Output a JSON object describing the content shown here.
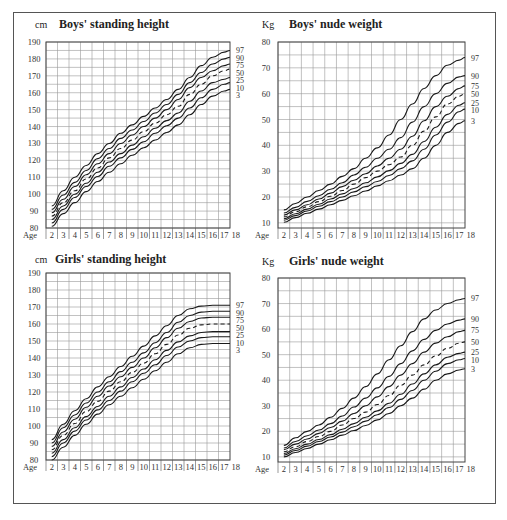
{
  "chart_data": [
    {
      "id": "boys-height",
      "type": "line",
      "title": "Boys' standing height",
      "ylabel": "cm",
      "xlabel": "Age",
      "x_ticks": [
        "2",
        "3",
        "4",
        "5",
        "6",
        "7",
        "8",
        "9",
        "10",
        "11",
        "12",
        "13",
        "14",
        "15",
        "16",
        "17",
        "18"
      ],
      "y_ticks": [
        80,
        90,
        100,
        110,
        120,
        130,
        140,
        150,
        160,
        170,
        180,
        190
      ],
      "ylim": [
        80,
        190
      ],
      "xlim": [
        2,
        18
      ],
      "grid": true,
      "legend_position": "right-end-labels",
      "x": [
        2,
        3,
        4,
        5,
        6,
        7,
        8,
        9,
        10,
        11,
        12,
        13,
        14,
        15,
        16,
        17,
        17.5
      ],
      "series": [
        {
          "name": "97",
          "dashed": false,
          "values": [
            93,
            102,
            110,
            117,
            124,
            130,
            136,
            141,
            146,
            151,
            156,
            162,
            169,
            176,
            181,
            184,
            185
          ]
        },
        {
          "name": "90",
          "dashed": false,
          "values": [
            91,
            99.5,
            107,
            114,
            121,
            127,
            133,
            138,
            143,
            148,
            153,
            159,
            166,
            172,
            177,
            180,
            181
          ]
        },
        {
          "name": "75",
          "dashed": false,
          "values": [
            89,
            97,
            104.5,
            111.5,
            118,
            124,
            130,
            135,
            140,
            145,
            150,
            156,
            163,
            169,
            173,
            176,
            177
          ]
        },
        {
          "name": "50",
          "dashed": true,
          "values": [
            87,
            95,
            102,
            109,
            115.5,
            121.5,
            127,
            132,
            137,
            142,
            147,
            152,
            159,
            165,
            170,
            173,
            174
          ]
        },
        {
          "name": "25",
          "dashed": false,
          "values": [
            85,
            93,
            100,
            106.5,
            113,
            119,
            124,
            129,
            134,
            139,
            143.5,
            148,
            155,
            161,
            166,
            168,
            169
          ]
        },
        {
          "name": "10",
          "dashed": false,
          "values": [
            83,
            91,
            98,
            104.5,
            110.5,
            116.5,
            121.5,
            126.5,
            131,
            136,
            140.5,
            145,
            151,
            157,
            162,
            165,
            166
          ]
        },
        {
          "name": "3",
          "dashed": false,
          "values": [
            81,
            88.5,
            95,
            101.5,
            107.5,
            113,
            118,
            123,
            127.5,
            132,
            136.5,
            141,
            147,
            153,
            158,
            161,
            162
          ]
        }
      ]
    },
    {
      "id": "boys-weight",
      "type": "line",
      "title": "Boys' nude weight",
      "ylabel": "Kg",
      "xlabel": "Age",
      "x_ticks": [
        "2",
        "3",
        "4",
        "5",
        "6",
        "7",
        "8",
        "9",
        "10",
        "11",
        "12",
        "13",
        "14",
        "15",
        "16",
        "17",
        "18"
      ],
      "y_ticks": [
        10,
        20,
        30,
        40,
        50,
        60,
        70,
        80
      ],
      "ylim": [
        8,
        80
      ],
      "xlim": [
        2,
        18
      ],
      "grid": true,
      "legend_position": "right-end-labels",
      "x": [
        2,
        3,
        4,
        5,
        6,
        7,
        8,
        9,
        10,
        11,
        12,
        13,
        14,
        15,
        16,
        17,
        17.5
      ],
      "series": [
        {
          "name": "97",
          "dashed": false,
          "values": [
            15,
            17.5,
            20,
            22.5,
            25,
            28,
            31,
            35,
            39,
            44,
            50,
            56,
            62,
            67,
            71,
            73,
            74
          ]
        },
        {
          "name": "90",
          "dashed": false,
          "values": [
            13.8,
            16,
            18.3,
            20.5,
            23,
            25.5,
            28.5,
            31.5,
            35,
            38.5,
            43,
            49,
            55,
            60,
            64,
            66.5,
            67
          ]
        },
        {
          "name": "75",
          "dashed": false,
          "values": [
            13,
            15,
            17,
            19.2,
            21.5,
            24,
            26.5,
            29,
            32,
            35,
            38.5,
            43.5,
            49.5,
            55,
            59,
            62,
            63
          ]
        },
        {
          "name": "50",
          "dashed": true,
          "values": [
            12.3,
            14.3,
            16.2,
            18.2,
            20.3,
            22.5,
            25,
            27.5,
            30,
            32.5,
            35.5,
            40,
            45.5,
            51,
            56,
            59,
            60
          ]
        },
        {
          "name": "25",
          "dashed": false,
          "values": [
            11.6,
            13.5,
            15.3,
            17.2,
            19.2,
            21.2,
            23.3,
            25.5,
            27.8,
            30.2,
            33,
            36.5,
            41.5,
            47,
            52,
            55.5,
            56.5
          ]
        },
        {
          "name": "10",
          "dashed": false,
          "values": [
            11,
            12.8,
            14.6,
            16.4,
            18.2,
            20,
            22,
            24,
            26,
            28.3,
            31,
            34,
            38.5,
            44,
            49,
            53,
            54
          ]
        },
        {
          "name": "3",
          "dashed": false,
          "values": [
            10.2,
            12,
            13.7,
            15.3,
            17,
            18.7,
            20.5,
            22.3,
            24.3,
            26.3,
            28.5,
            31,
            35,
            40,
            45,
            48.5,
            49.5
          ]
        }
      ]
    },
    {
      "id": "girls-height",
      "type": "line",
      "title": "Girls' standing height",
      "ylabel": "cm",
      "xlabel": "Age",
      "x_ticks": [
        "2",
        "3",
        "4",
        "5",
        "6",
        "7",
        "8",
        "9",
        "10",
        "11",
        "12",
        "13",
        "14",
        "15",
        "16",
        "17",
        "18"
      ],
      "y_ticks": [
        80,
        90,
        100,
        110,
        120,
        130,
        140,
        150,
        160,
        170,
        180,
        190
      ],
      "ylim": [
        80,
        190
      ],
      "xlim": [
        2,
        18
      ],
      "grid": true,
      "legend_position": "right-end-labels",
      "x": [
        2,
        3,
        4,
        5,
        6,
        7,
        8,
        9,
        10,
        11,
        12,
        13,
        14,
        15,
        16,
        17,
        17.5
      ],
      "series": [
        {
          "name": "97",
          "dashed": false,
          "values": [
            92,
            101,
            109,
            116,
            123,
            129,
            135,
            141,
            147,
            153,
            159,
            165,
            169,
            170.5,
            171,
            171,
            171
          ]
        },
        {
          "name": "90",
          "dashed": false,
          "values": [
            90,
            99,
            106.5,
            113.5,
            120,
            126,
            132,
            137.5,
            143,
            149,
            155,
            161,
            165,
            167,
            167.5,
            167.5,
            167.5
          ]
        },
        {
          "name": "75",
          "dashed": false,
          "values": [
            88,
            96.5,
            104,
            111,
            117.5,
            123.5,
            129,
            134.5,
            140,
            146,
            152,
            157.5,
            161.5,
            163.5,
            164,
            164,
            164
          ]
        },
        {
          "name": "50",
          "dashed": true,
          "values": [
            86,
            94.5,
            101.5,
            108.5,
            114.5,
            120.5,
            126,
            131.5,
            137,
            142.5,
            148,
            153.5,
            157.5,
            159.5,
            160,
            160,
            160
          ]
        },
        {
          "name": "25",
          "dashed": false,
          "values": [
            84,
            92,
            99,
            105.5,
            111.5,
            117.5,
            123,
            128.5,
            133.5,
            139,
            144.5,
            149.5,
            153,
            155,
            155.5,
            155.5,
            155.5
          ]
        },
        {
          "name": "10",
          "dashed": false,
          "values": [
            82,
            90,
            97,
            103.5,
            109.5,
            115,
            120.5,
            126,
            131,
            136,
            141.5,
            146.5,
            150,
            152,
            152.5,
            152.5,
            152.5
          ]
        },
        {
          "name": "3",
          "dashed": false,
          "values": [
            80,
            87.5,
            94.5,
            101,
            107,
            112.5,
            117.5,
            122.5,
            127.5,
            132.5,
            137.5,
            142.5,
            146,
            148,
            148.5,
            148.5,
            148.5
          ]
        }
      ]
    },
    {
      "id": "girls-weight",
      "type": "line",
      "title": "Girls' nude weight",
      "ylabel": "Kg",
      "xlabel": "Age",
      "x_ticks": [
        "2",
        "3",
        "4",
        "5",
        "6",
        "7",
        "8",
        "9",
        "10",
        "11",
        "12",
        "13",
        "14",
        "15",
        "16",
        "17",
        "18"
      ],
      "y_ticks": [
        10,
        20,
        30,
        40,
        50,
        60,
        70,
        80
      ],
      "ylim": [
        8,
        80
      ],
      "xlim": [
        2,
        18
      ],
      "grid": true,
      "legend_position": "right-end-labels",
      "x": [
        2,
        3,
        4,
        5,
        6,
        7,
        8,
        9,
        10,
        11,
        12,
        13,
        14,
        15,
        16,
        17,
        17.5
      ],
      "series": [
        {
          "name": "97",
          "dashed": false,
          "values": [
            14.5,
            17.5,
            20,
            22.5,
            25.5,
            29,
            33,
            37.5,
            42.5,
            48,
            53.5,
            59,
            64,
            67.5,
            70,
            71.5,
            72
          ]
        },
        {
          "name": "90",
          "dashed": false,
          "values": [
            13.5,
            16,
            18.3,
            20.5,
            23,
            26,
            29.5,
            33,
            37,
            41.5,
            46.5,
            51.5,
            56,
            59.5,
            62,
            63.5,
            64
          ]
        },
        {
          "name": "75",
          "dashed": false,
          "values": [
            12.8,
            15,
            17,
            19.2,
            21.5,
            24,
            27,
            30,
            33.5,
            37.5,
            42,
            46.5,
            51,
            54.5,
            57,
            59,
            59.5
          ]
        },
        {
          "name": "50",
          "dashed": true,
          "values": [
            12,
            14,
            16,
            18,
            20,
            22.5,
            25,
            27.5,
            30.5,
            34,
            38,
            42,
            46,
            49.5,
            52.5,
            54.5,
            55
          ]
        },
        {
          "name": "25",
          "dashed": false,
          "values": [
            11.3,
            13.2,
            15,
            16.8,
            18.7,
            20.8,
            23,
            25.5,
            28,
            31,
            34.5,
            38.5,
            42.5,
            46,
            49,
            50.5,
            51
          ]
        },
        {
          "name": "10",
          "dashed": false,
          "values": [
            10.7,
            12.5,
            14.2,
            16,
            17.8,
            19.7,
            21.8,
            24,
            26.5,
            29.3,
            32.5,
            36,
            40,
            43.5,
            46.5,
            48,
            48.5
          ]
        },
        {
          "name": "3",
          "dashed": false,
          "values": [
            10,
            11.7,
            13.3,
            15,
            16.7,
            18.5,
            20.3,
            22.3,
            24.5,
            27,
            30,
            33,
            36.5,
            40,
            42.5,
            44,
            44.5
          ]
        }
      ]
    }
  ]
}
